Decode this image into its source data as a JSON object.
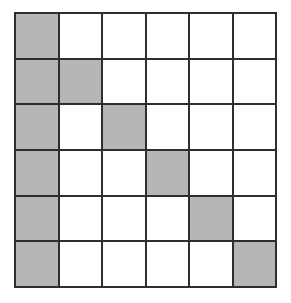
{
  "figure": {
    "name": "shaded-grid-diagram",
    "type": "grid",
    "rows": 6,
    "columns": 6,
    "cell_fill_shaded": "#b6b6b6",
    "cell_fill_empty": "#ffffff",
    "line_color": "#2e2e2e",
    "background": "#ffffff"
  },
  "chart_data": {
    "type": "heatmap",
    "title": "",
    "xlabel": "",
    "ylabel": "",
    "categories": [
      "1",
      "2",
      "3",
      "4",
      "5",
      "6"
    ],
    "row_labels": [
      "1",
      "2",
      "3",
      "4",
      "5",
      "6"
    ],
    "legend": [],
    "grid": true,
    "values": [
      [
        1,
        0,
        0,
        0,
        0,
        0
      ],
      [
        1,
        1,
        0,
        0,
        0,
        0
      ],
      [
        1,
        0,
        1,
        0,
        0,
        0
      ],
      [
        1,
        0,
        0,
        1,
        0,
        0
      ],
      [
        1,
        0,
        0,
        0,
        1,
        0
      ],
      [
        1,
        0,
        0,
        0,
        0,
        1
      ]
    ],
    "value_meanings": {
      "0": "unshaded",
      "1": "shaded"
    },
    "shaded_cells": [
      [
        1,
        1
      ],
      [
        2,
        1
      ],
      [
        2,
        2
      ],
      [
        3,
        1
      ],
      [
        3,
        3
      ],
      [
        4,
        1
      ],
      [
        4,
        4
      ],
      [
        5,
        1
      ],
      [
        5,
        5
      ],
      [
        6,
        1
      ],
      [
        6,
        6
      ]
    ],
    "shaded_count": 11,
    "total_cells": 36
  }
}
